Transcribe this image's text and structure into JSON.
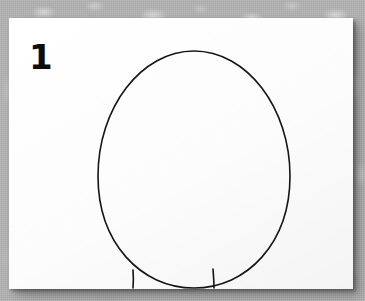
{
  "scene": {
    "width": 365,
    "height": 301,
    "background_color": "#b4b4b4",
    "background_description": "mottled gray speckled surface"
  },
  "paper": {
    "color": "#fdfdfd",
    "left": 9,
    "top": 18,
    "width": 344,
    "height": 271,
    "shadow_color": "#000000"
  },
  "step": {
    "number": "1"
  },
  "drawing": {
    "ink_color": "#141414",
    "stroke_width": 1.6,
    "shapes": [
      {
        "name": "egg-outline",
        "type": "oval",
        "center_x": 185,
        "center_y": 158,
        "radius_x": 96,
        "radius_y": 125,
        "label": "large vertical egg shaped oval"
      },
      {
        "name": "left-leg",
        "type": "line",
        "x1": 124,
        "y1": 253,
        "x2": 124,
        "y2": 270,
        "label": "short vertical line at lower left of oval"
      },
      {
        "name": "right-leg",
        "type": "line",
        "x1": 204,
        "y1": 252,
        "x2": 205,
        "y2": 270,
        "label": "short vertical line at lower right of oval"
      }
    ]
  }
}
